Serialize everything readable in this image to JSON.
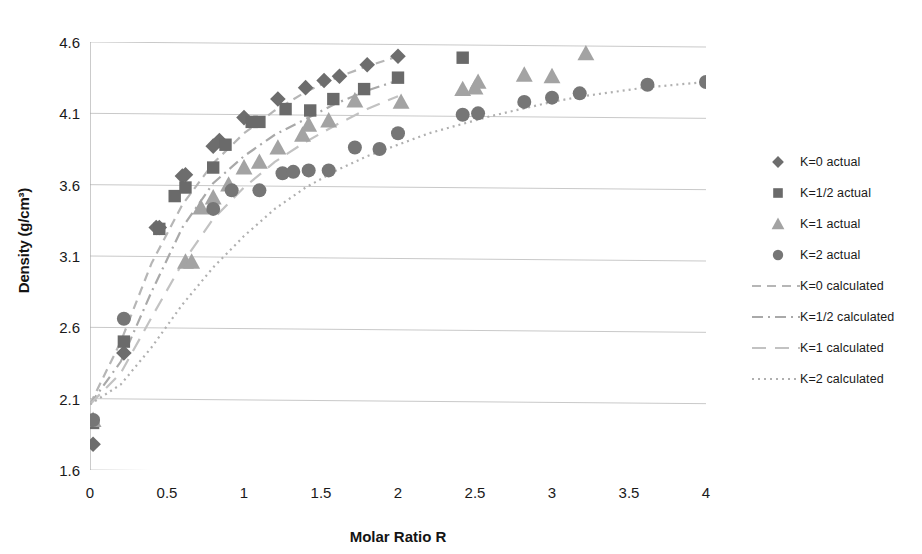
{
  "chart_data": {
    "type": "scatter",
    "title": "",
    "xlabel": "Molar Ratio R",
    "ylabel": "Density (g/cm³)",
    "xlim": [
      0,
      4
    ],
    "ylim": [
      1.6,
      4.6
    ],
    "xticks": [
      "0",
      "0.5",
      "1",
      "1.5",
      "2",
      "2.5",
      "3",
      "3.5",
      "4"
    ],
    "xtick_values": [
      0,
      0.5,
      1,
      1.5,
      2,
      2.5,
      3,
      3.5,
      4
    ],
    "yticks": [
      "1.6",
      "2.1",
      "2.6",
      "3.1",
      "3.6",
      "4.1",
      "4.6"
    ],
    "ytick_values": [
      1.6,
      2.1,
      2.6,
      3.1,
      3.6,
      4.1,
      4.6
    ],
    "grid": "horizontal",
    "legend_position": "right",
    "colors": {
      "k0": "#6d6d6d",
      "k0_5": "#6a6a6a",
      "k1": "#a3a3a3",
      "k2": "#767676",
      "k0_line": "#b6b6b6",
      "k0_5_line": "#a9a9a9",
      "k1_line": "#c2c2c2",
      "k2_line": "#b0b0b0",
      "grid": "#c9c9c9",
      "axis": "#a8a8a8",
      "text": "#1a1a1a"
    },
    "series": [
      {
        "name": "K=0 actual",
        "key": "k0",
        "marker": "diamond",
        "kind": "actual",
        "points": [
          [
            0.02,
            1.78
          ],
          [
            0.22,
            2.42
          ],
          [
            0.43,
            3.3
          ],
          [
            0.45,
            3.3
          ],
          [
            0.6,
            3.66
          ],
          [
            0.62,
            3.67
          ],
          [
            0.8,
            3.87
          ],
          [
            0.84,
            3.91
          ],
          [
            1.0,
            4.07
          ],
          [
            1.22,
            4.2
          ],
          [
            1.4,
            4.28
          ],
          [
            1.52,
            4.33
          ],
          [
            1.62,
            4.36
          ],
          [
            1.8,
            4.44
          ],
          [
            2.0,
            4.5
          ]
        ]
      },
      {
        "name": "K=1/2 actual",
        "key": "k0_5",
        "marker": "square",
        "kind": "actual",
        "points": [
          [
            0.02,
            1.93
          ],
          [
            0.22,
            2.5
          ],
          [
            0.45,
            3.29
          ],
          [
            0.55,
            3.52
          ],
          [
            0.62,
            3.58
          ],
          [
            0.8,
            3.72
          ],
          [
            0.88,
            3.88
          ],
          [
            1.05,
            4.04
          ],
          [
            1.1,
            4.04
          ],
          [
            1.27,
            4.13
          ],
          [
            1.43,
            4.12
          ],
          [
            1.58,
            4.2
          ],
          [
            1.78,
            4.27
          ],
          [
            2.0,
            4.35
          ],
          [
            2.42,
            4.49
          ]
        ]
      },
      {
        "name": "K=1 actual",
        "key": "k1",
        "marker": "triangle",
        "kind": "actual",
        "points": [
          [
            0.02,
            1.95
          ],
          [
            0.62,
            3.06
          ],
          [
            0.66,
            3.06
          ],
          [
            0.72,
            3.44
          ],
          [
            0.8,
            3.51
          ],
          [
            0.9,
            3.6
          ],
          [
            1.0,
            3.72
          ],
          [
            1.1,
            3.76
          ],
          [
            1.22,
            3.86
          ],
          [
            1.38,
            3.95
          ],
          [
            1.42,
            4.02
          ],
          [
            1.55,
            4.05
          ],
          [
            1.72,
            4.19
          ],
          [
            2.02,
            4.18
          ],
          [
            2.42,
            4.27
          ],
          [
            2.5,
            4.28
          ],
          [
            2.52,
            4.32
          ],
          [
            2.82,
            4.37
          ],
          [
            3.0,
            4.36
          ],
          [
            3.22,
            4.52
          ]
        ]
      },
      {
        "name": "K=2 actual",
        "key": "k2",
        "marker": "circle",
        "kind": "actual",
        "points": [
          [
            0.02,
            1.95
          ],
          [
            0.22,
            2.66
          ],
          [
            0.8,
            3.43
          ],
          [
            0.92,
            3.56
          ],
          [
            1.1,
            3.56
          ],
          [
            1.25,
            3.68
          ],
          [
            1.32,
            3.69
          ],
          [
            1.42,
            3.7
          ],
          [
            1.55,
            3.7
          ],
          [
            1.72,
            3.86
          ],
          [
            1.88,
            3.85
          ],
          [
            2.0,
            3.96
          ],
          [
            2.42,
            4.09
          ],
          [
            2.52,
            4.1
          ],
          [
            2.82,
            4.18
          ],
          [
            3.0,
            4.21
          ],
          [
            3.18,
            4.24
          ],
          [
            3.62,
            4.3
          ],
          [
            4.0,
            4.32
          ]
        ]
      },
      {
        "name": "K=0 calculated",
        "key": "k0",
        "kind": "calculated",
        "dash": "dashed",
        "points": [
          [
            0.0,
            2.06
          ],
          [
            0.2,
            2.5
          ],
          [
            0.4,
            3.05
          ],
          [
            0.6,
            3.46
          ],
          [
            0.8,
            3.75
          ],
          [
            1.0,
            3.96
          ],
          [
            1.2,
            4.12
          ],
          [
            1.4,
            4.25
          ],
          [
            1.6,
            4.35
          ],
          [
            1.8,
            4.43
          ],
          [
            2.0,
            4.5
          ]
        ]
      },
      {
        "name": "K=1/2 calculated",
        "key": "k0_5",
        "kind": "calculated",
        "dash": "dash-dot",
        "points": [
          [
            0.0,
            2.06
          ],
          [
            0.2,
            2.36
          ],
          [
            0.4,
            2.85
          ],
          [
            0.6,
            3.3
          ],
          [
            0.8,
            3.61
          ],
          [
            1.0,
            3.8
          ],
          [
            1.2,
            3.95
          ],
          [
            1.4,
            4.06
          ],
          [
            1.6,
            4.17
          ],
          [
            1.8,
            4.26
          ],
          [
            2.0,
            4.33
          ]
        ]
      },
      {
        "name": "K=1 calculated",
        "key": "k1",
        "kind": "calculated",
        "dash": "long-dash",
        "points": [
          [
            0.0,
            2.06
          ],
          [
            0.2,
            2.28
          ],
          [
            0.4,
            2.67
          ],
          [
            0.6,
            3.05
          ],
          [
            0.8,
            3.36
          ],
          [
            1.0,
            3.58
          ],
          [
            1.2,
            3.76
          ],
          [
            1.4,
            3.9
          ],
          [
            1.6,
            4.02
          ],
          [
            1.8,
            4.13
          ],
          [
            2.0,
            4.22
          ]
        ]
      },
      {
        "name": "K=2 calculated",
        "key": "k2",
        "kind": "calculated",
        "dash": "dotted",
        "points": [
          [
            0.0,
            2.06
          ],
          [
            0.2,
            2.2
          ],
          [
            0.4,
            2.46
          ],
          [
            0.6,
            2.76
          ],
          [
            0.8,
            3.02
          ],
          [
            1.0,
            3.24
          ],
          [
            1.2,
            3.43
          ],
          [
            1.4,
            3.58
          ],
          [
            1.6,
            3.7
          ],
          [
            1.8,
            3.8
          ],
          [
            2.0,
            3.88
          ],
          [
            2.2,
            3.96
          ],
          [
            2.4,
            4.02
          ],
          [
            2.6,
            4.08
          ],
          [
            2.8,
            4.13
          ],
          [
            3.0,
            4.18
          ],
          [
            3.2,
            4.22
          ],
          [
            3.4,
            4.25
          ],
          [
            3.6,
            4.28
          ],
          [
            3.8,
            4.3
          ],
          [
            4.0,
            4.32
          ]
        ]
      }
    ],
    "legend": [
      {
        "label": "K=0 actual",
        "marker": "diamond",
        "key": "k0",
        "kind": "actual"
      },
      {
        "label": "K=1/2 actual",
        "marker": "square",
        "key": "k0_5",
        "kind": "actual"
      },
      {
        "label": "K=1 actual",
        "marker": "triangle",
        "key": "k1",
        "kind": "actual"
      },
      {
        "label": "K=2 actual",
        "marker": "circle",
        "key": "k2",
        "kind": "actual"
      },
      {
        "label": "K=0 calculated",
        "dash": "dashed",
        "key": "k0",
        "kind": "calculated"
      },
      {
        "label": "K=1/2 calculated",
        "dash": "dash-dot",
        "key": "k0_5",
        "kind": "calculated"
      },
      {
        "label": "K=1 calculated",
        "dash": "long-dash",
        "key": "k1",
        "kind": "calculated"
      },
      {
        "label": "K=2 calculated",
        "dash": "dotted",
        "key": "k2",
        "kind": "calculated"
      }
    ]
  }
}
